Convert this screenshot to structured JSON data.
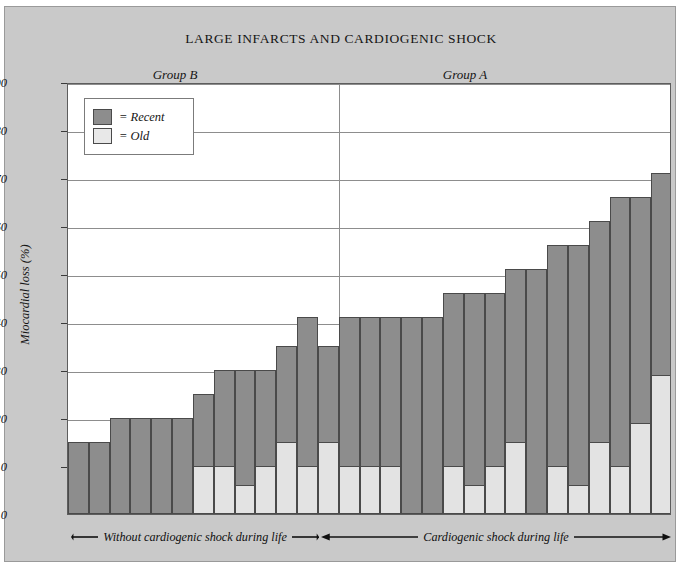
{
  "figure": {
    "title": "LARGE INFARCTS AND CARDIOGENIC SHOCK",
    "background_color": "#c9c9c9",
    "plot_background_color": "#ffffff"
  },
  "legend": {
    "position": "top-left-inside-plot",
    "items": [
      {
        "swatch": "recent-swatch",
        "label": "= Recent",
        "color": "#8d8d8d"
      },
      {
        "swatch": "old-swatch",
        "label": "= Old",
        "color": "#e8e8e8"
      }
    ]
  },
  "groups": [
    {
      "id": "group-b",
      "label": "Group B"
    },
    {
      "id": "group-a",
      "label": "Group A"
    }
  ],
  "annotations": {
    "left": "Without cardiogenic shock during life",
    "right": "Cardiogenic shock during life"
  },
  "chart_data": {
    "type": "bar",
    "title": "LARGE INFARCTS AND CARDIOGENIC SHOCK",
    "subtitle": "",
    "xlabel": "",
    "ylabel": "Miocardial loss (%)",
    "ylim": [
      0,
      90
    ],
    "yticks": [
      0,
      10,
      20,
      30,
      40,
      50,
      60,
      70,
      80,
      90
    ],
    "grid": "horizontal",
    "stacked": true,
    "legend_position": "top-left",
    "series": [
      {
        "name": "Old",
        "color": "#e8e8e8",
        "values": [
          0,
          0,
          0,
          0,
          0,
          0,
          10,
          10,
          6,
          10,
          15,
          10,
          15,
          10,
          10,
          10,
          0,
          0,
          10,
          6,
          10,
          15,
          0,
          10,
          6,
          15,
          10,
          19,
          29
        ]
      },
      {
        "name": "Recent",
        "color": "#8d8d8d",
        "values": [
          15,
          15,
          5,
          20,
          20,
          20,
          15,
          20,
          24,
          20,
          20,
          31,
          20,
          31,
          31,
          31,
          41,
          41,
          36,
          40,
          36,
          36,
          51,
          46,
          50,
          46,
          56,
          47,
          42
        ]
      }
    ],
    "totals": [
      15,
      15,
      20,
      20,
      20,
      20,
      25,
      30,
      30,
      30,
      35,
      41,
      35,
      41,
      41,
      41,
      41,
      41,
      46,
      46,
      46,
      51,
      51,
      56,
      56,
      61,
      66,
      66,
      71
    ],
    "group_split_after_index": 12,
    "groups": [
      "Group B",
      "Group A"
    ],
    "annotations": [
      "Without cardiogenic shock during life",
      "Cardiogenic shock during life"
    ]
  }
}
